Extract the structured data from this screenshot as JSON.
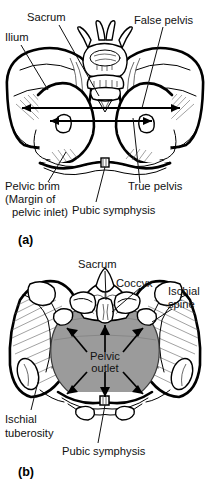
{
  "figure": {
    "shading": {
      "pelvic_outlet_fill": "#9b9b9b",
      "bone_outline": "#000000",
      "background": "#ffffff"
    }
  },
  "panel_a": {
    "tag": "(a)",
    "view": "anterior view of the bony pelvis",
    "labels": {
      "ilium": "Ilium",
      "sacrum": "Sacrum",
      "false_pelvis": "False pelvis",
      "pelvic_brim_line1": "Pelvic brim",
      "pelvic_brim_line2": "(Margin of",
      "pelvic_brim_line3": "pelvic inlet)",
      "true_pelvis": "True pelvis",
      "pubic_symphysis": "Pubic symphysis"
    },
    "dimension_arrows": [
      {
        "name": "false-pelvis-width-arrow",
        "style": "double-headed horizontal"
      },
      {
        "name": "true-pelvis-width-arrow",
        "style": "double-headed horizontal"
      }
    ]
  },
  "panel_b": {
    "tag": "(b)",
    "view": "inferior view of the bony pelvis",
    "labels": {
      "sacrum": "Sacrum",
      "coccyx": "Coccyx",
      "ischial_spine_line1": "Ischial",
      "ischial_spine_line2": "spine",
      "pelvic_outlet_line1": "Pelvic",
      "pelvic_outlet_line2": "outlet",
      "ischial_tuberosity_line1": "Ischial",
      "ischial_tuberosity_line2": "tuberosity",
      "pubic_symphysis": "Pubic symphysis"
    },
    "outlet_arrows": {
      "count": 6,
      "directions": [
        "up-left",
        "up",
        "up-right",
        "down-left",
        "down",
        "down-right"
      ]
    }
  }
}
